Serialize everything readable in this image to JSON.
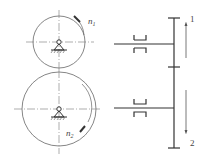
{
  "diagram": {
    "type": "gear-train-schematic",
    "colors": {
      "line": "#333333",
      "thin": "#666666",
      "background": "#ffffff"
    },
    "gears": [
      {
        "id": "gear1",
        "label": "n",
        "subscript": "1",
        "cx": 59,
        "cy": 42,
        "r": 26,
        "rotation": "clockwise"
      },
      {
        "id": "gear2",
        "label": "n",
        "subscript": "2",
        "cx": 59,
        "cy": 109,
        "r": 37,
        "rotation": "clockwise"
      }
    ],
    "side_view": {
      "bar_x": 174,
      "bar_top": 18,
      "bar_bottom": 148,
      "middle_tick_y": 67,
      "shafts": [
        {
          "y": 44,
          "x_start": 114,
          "bearing_x": 136
        },
        {
          "y": 108,
          "x_start": 114,
          "bearing_x": 136
        }
      ]
    },
    "direction_arrows": [
      {
        "label": "1",
        "direction": "up",
        "x": 186,
        "y_from": 58,
        "y_to": 22
      },
      {
        "label": "2",
        "direction": "down",
        "x": 186,
        "y_from": 90,
        "y_to": 134
      }
    ]
  }
}
